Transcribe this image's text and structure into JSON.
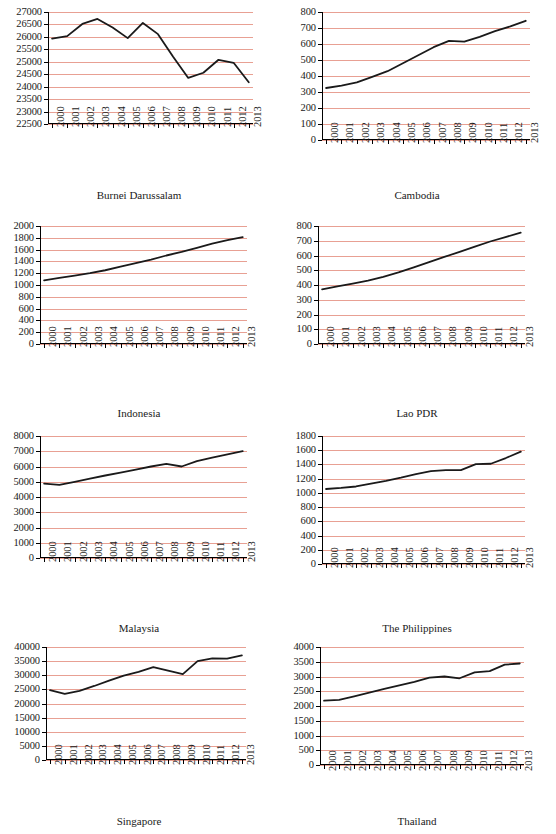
{
  "page": {
    "width": 556,
    "height": 834,
    "background": "#ffffff",
    "gridline_color": "#e8a093",
    "axis_color": "#000000",
    "line_color": "#1a1a1a",
    "clipped_title": ""
  },
  "chart_data": [
    {
      "type": "line",
      "title": "Burnei Darussalam",
      "caption": "Burnei Darussalam",
      "xlabel": "",
      "ylabel": "",
      "grid": true,
      "legend": "none",
      "x": [
        "2000",
        "2001",
        "2002",
        "2003",
        "2004",
        "2005",
        "2006",
        "2007",
        "2008",
        "2009",
        "2010",
        "2011",
        "2012",
        "2013"
      ],
      "categories": [
        "2000",
        "2001",
        "2002",
        "2003",
        "2004",
        "2005",
        "2006",
        "2007",
        "2008",
        "2009",
        "2010",
        "2011",
        "2012",
        "2013"
      ],
      "values": [
        25930,
        26030,
        26520,
        26720,
        26380,
        25950,
        26560,
        26110,
        25200,
        24350,
        24560,
        25080,
        24960,
        24180
      ],
      "ylim": [
        22500,
        27000
      ],
      "yticks": [
        22500,
        23000,
        23500,
        24000,
        24500,
        25000,
        25500,
        26000,
        26500,
        27000
      ],
      "ytick_labels": [
        "22500",
        "23000",
        "23500",
        "24000",
        "24500",
        "25000",
        "25500",
        "26000",
        "26500",
        "27000"
      ]
    },
    {
      "type": "line",
      "title": "Cambodia",
      "caption": "Cambodia",
      "xlabel": "",
      "ylabel": "",
      "grid": true,
      "legend": "none",
      "x": [
        "2000",
        "2001",
        "2002",
        "2003",
        "2004",
        "2005",
        "2006",
        "2007",
        "2008",
        "2009",
        "2010",
        "2011",
        "2012",
        "2013"
      ],
      "categories": [
        "2000",
        "2001",
        "2002",
        "2003",
        "2004",
        "2005",
        "2006",
        "2007",
        "2008",
        "2009",
        "2010",
        "2011",
        "2012",
        "2013"
      ],
      "values": [
        325,
        340,
        360,
        395,
        430,
        480,
        530,
        580,
        620,
        615,
        645,
        680,
        710,
        745
      ],
      "ylim": [
        0,
        800
      ],
      "yticks": [
        0,
        100,
        200,
        300,
        400,
        500,
        600,
        700,
        800
      ],
      "ytick_labels": [
        "0",
        "100",
        "200",
        "300",
        "400",
        "500",
        "600",
        "700",
        "800"
      ]
    },
    {
      "type": "line",
      "title": "Indonesia",
      "caption": "Indonesia",
      "xlabel": "",
      "ylabel": "",
      "grid": true,
      "legend": "none",
      "x": [
        "2000",
        "2001",
        "2002",
        "2003",
        "2004",
        "2005",
        "2006",
        "2007",
        "2008",
        "2009",
        "2010",
        "2011",
        "2012",
        "2013"
      ],
      "categories": [
        "2000",
        "2001",
        "2002",
        "2003",
        "2004",
        "2005",
        "2006",
        "2007",
        "2008",
        "2009",
        "2010",
        "2011",
        "2012",
        "2013"
      ],
      "values": [
        1080,
        1120,
        1160,
        1200,
        1250,
        1310,
        1370,
        1430,
        1500,
        1560,
        1630,
        1700,
        1760,
        1810
      ],
      "ylim": [
        0,
        2000
      ],
      "yticks": [
        0,
        200,
        400,
        600,
        800,
        1000,
        1200,
        1400,
        1600,
        1800,
        2000
      ],
      "ytick_labels": [
        "0",
        "200",
        "400",
        "600",
        "800",
        "1000",
        "1200",
        "1400",
        "1600",
        "1800",
        "2000"
      ]
    },
    {
      "type": "line",
      "title": "Lao PDR",
      "caption": "Lao PDR",
      "xlabel": "",
      "ylabel": "",
      "grid": true,
      "legend": "none",
      "x": [
        "2000",
        "2001",
        "2002",
        "2003",
        "2004",
        "2005",
        "2006",
        "2007",
        "2008",
        "2009",
        "2010",
        "2011",
        "2012",
        "2013"
      ],
      "categories": [
        "2000",
        "2001",
        "2002",
        "2003",
        "2004",
        "2005",
        "2006",
        "2007",
        "2008",
        "2009",
        "2010",
        "2011",
        "2012",
        "2013"
      ],
      "values": [
        370,
        390,
        410,
        430,
        455,
        485,
        520,
        555,
        590,
        625,
        660,
        695,
        725,
        755
      ],
      "ylim": [
        0,
        800
      ],
      "yticks": [
        0,
        100,
        200,
        300,
        400,
        500,
        600,
        700,
        800
      ],
      "ytick_labels": [
        "0",
        "100",
        "200",
        "300",
        "400",
        "500",
        "600",
        "700",
        "800"
      ]
    },
    {
      "type": "line",
      "title": "Malaysia",
      "caption": "Malaysia",
      "xlabel": "",
      "ylabel": "",
      "grid": true,
      "legend": "none",
      "x": [
        "2000",
        "2001",
        "2002",
        "2003",
        "2004",
        "2005",
        "2006",
        "2007",
        "2008",
        "2009",
        "2010",
        "2011",
        "2012",
        "2013"
      ],
      "categories": [
        "2000",
        "2001",
        "2002",
        "2003",
        "2004",
        "2005",
        "2006",
        "2007",
        "2008",
        "2009",
        "2010",
        "2011",
        "2012",
        "2013"
      ],
      "values": [
        4880,
        4790,
        4990,
        5200,
        5410,
        5600,
        5790,
        6000,
        6170,
        6000,
        6350,
        6580,
        6800,
        7010
      ],
      "ylim": [
        0,
        8000
      ],
      "yticks": [
        0,
        1000,
        2000,
        3000,
        4000,
        5000,
        6000,
        7000,
        8000
      ],
      "ytick_labels": [
        "0",
        "1000",
        "2000",
        "3000",
        "4000",
        "5000",
        "6000",
        "7000",
        "8000"
      ]
    },
    {
      "type": "line",
      "title": "The Philippines",
      "caption": "The Philippines",
      "xlabel": "",
      "ylabel": "",
      "grid": true,
      "legend": "none",
      "x": [
        "2000",
        "2001",
        "2002",
        "2003",
        "2004",
        "2005",
        "2006",
        "2007",
        "2008",
        "2009",
        "2010",
        "2011",
        "2012",
        "2013"
      ],
      "categories": [
        "2000",
        "2001",
        "2002",
        "2003",
        "2004",
        "2005",
        "2006",
        "2007",
        "2008",
        "2009",
        "2010",
        "2011",
        "2012",
        "2013"
      ],
      "values": [
        1055,
        1070,
        1090,
        1130,
        1170,
        1215,
        1265,
        1305,
        1320,
        1320,
        1405,
        1410,
        1490,
        1580
      ],
      "ylim": [
        0,
        1800
      ],
      "yticks": [
        0,
        200,
        400,
        600,
        800,
        1000,
        1200,
        1400,
        1600,
        1800
      ],
      "ytick_labels": [
        "0",
        "200",
        "400",
        "600",
        "800",
        "1000",
        "1200",
        "1400",
        "1600",
        "1800"
      ]
    },
    {
      "type": "line",
      "title": "Singapore",
      "caption": "Singapore",
      "xlabel": "",
      "ylabel": "",
      "grid": true,
      "legend": "none",
      "x": [
        "2000",
        "2001",
        "2002",
        "2003",
        "2004",
        "2005",
        "2006",
        "2007",
        "2008",
        "2009",
        "2010",
        "2011",
        "2012",
        "2013"
      ],
      "categories": [
        "2000",
        "2001",
        "2002",
        "2003",
        "2004",
        "2005",
        "2006",
        "2007",
        "2008",
        "2009",
        "2010",
        "2011",
        "2012",
        "2013"
      ],
      "values": [
        24700,
        23400,
        24500,
        26200,
        28100,
        29900,
        31200,
        32900,
        31600,
        30400,
        35000,
        36000,
        35900,
        37000
      ],
      "ylim": [
        0,
        40000
      ],
      "yticks": [
        0,
        5000,
        10000,
        15000,
        20000,
        25000,
        30000,
        35000,
        40000
      ],
      "ytick_labels": [
        "0",
        "5000",
        "10000",
        "15000",
        "20000",
        "25000",
        "30000",
        "35000",
        "40000"
      ]
    },
    {
      "type": "line",
      "title": "Thailand",
      "caption": "Thailand",
      "xlabel": "",
      "ylabel": "",
      "grid": true,
      "legend": "none",
      "x": [
        "2000",
        "2001",
        "2002",
        "2003",
        "2004",
        "2005",
        "2006",
        "2007",
        "2008",
        "2009",
        "2010",
        "2011",
        "2012",
        "2013"
      ],
      "categories": [
        "2000",
        "2001",
        "2002",
        "2003",
        "2004",
        "2005",
        "2006",
        "2007",
        "2008",
        "2009",
        "2010",
        "2011",
        "2012",
        "2013"
      ],
      "values": [
        2180,
        2210,
        2330,
        2450,
        2580,
        2700,
        2820,
        2960,
        3000,
        2940,
        3140,
        3180,
        3400,
        3440
      ],
      "ylim": [
        0,
        4000
      ],
      "yticks": [
        0,
        500,
        1000,
        1500,
        2000,
        2500,
        3000,
        3500,
        4000
      ],
      "ytick_labels": [
        "0",
        "500",
        "1000",
        "1500",
        "2000",
        "2500",
        "3000",
        "3500",
        "4000"
      ]
    }
  ]
}
